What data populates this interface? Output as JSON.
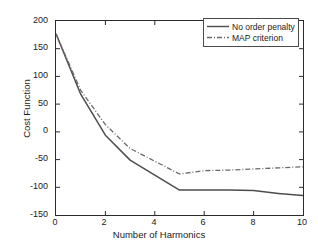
{
  "chart_data": {
    "type": "line",
    "title": "",
    "xlabel": "Number of Harmonics",
    "ylabel": "Cost Function",
    "xlim": [
      0,
      10
    ],
    "ylim": [
      -150,
      200
    ],
    "xticks": [
      "0",
      "2",
      "4",
      "6",
      "8",
      "10"
    ],
    "xtick_values": [
      0,
      2,
      4,
      6,
      8,
      10
    ],
    "yticks": [
      "200",
      "150",
      "100",
      "50",
      "0",
      "-50",
      "-100",
      "-150"
    ],
    "ytick_values": [
      200,
      150,
      100,
      50,
      0,
      -50,
      -100,
      -150
    ],
    "grid": false,
    "legend_position": "top-right",
    "x": [
      0,
      1,
      2,
      3,
      4,
      5,
      6,
      7,
      8,
      9,
      10
    ],
    "series": [
      {
        "name": "No order penalty",
        "style": "solid",
        "color": "#4d4d4d",
        "values": [
          177,
          68,
          -6,
          -51,
          -78,
          -105,
          -105,
          -105,
          -106,
          -111,
          -115
        ]
      },
      {
        "name": "MAP criterion",
        "style": "dash-dot",
        "color": "#6a6a6a",
        "values": [
          177,
          75,
          13,
          -30,
          -53,
          -76,
          -70,
          -69,
          -67,
          -65,
          -63
        ]
      }
    ]
  },
  "axis": {
    "x_title": "Number of Harmonics",
    "y_title": "Cost Function"
  },
  "legend": {
    "items": [
      {
        "label": "No order penalty",
        "style": "solid"
      },
      {
        "label": "MAP criterion",
        "style": "dash-dot"
      }
    ]
  },
  "colors": {
    "axis": "#2b2b2b",
    "series_solid": "#4d4d4d",
    "series_dashdot": "#6a6a6a",
    "background": "#ffffff",
    "text": "#1a1a1a"
  }
}
